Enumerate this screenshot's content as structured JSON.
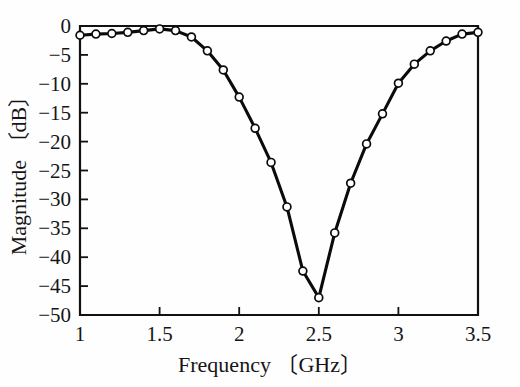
{
  "chart_data": {
    "type": "line",
    "title": "",
    "subtitle": "",
    "xlabel": "Frequency 〔GHz〕",
    "ylabel": "Magnitude 〔dB〕",
    "xlabel_name": "Frequency",
    "xlabel_unit": "〔GHz〕",
    "ylabel_name": "Magnitude",
    "ylabel_unit": "〔dB〕",
    "xlim": [
      1,
      3.5
    ],
    "ylim": [
      -50,
      0
    ],
    "xticks": [
      1,
      1.5,
      2,
      2.5,
      3,
      3.5
    ],
    "xtick_labels": [
      "1",
      "1.5",
      "2",
      "2.5",
      "3",
      "3.5"
    ],
    "yticks": [
      0,
      -5,
      -10,
      -15,
      -20,
      -25,
      -30,
      -35,
      -40,
      -45,
      -50
    ],
    "ytick_labels": [
      "0",
      "−5",
      "−10",
      "−15",
      "−20",
      "−25",
      "−30",
      "−35",
      "−40",
      "−45",
      "−50"
    ],
    "grid": false,
    "legend": false,
    "legend_position": "none",
    "line_color": "#0b0b0b",
    "marker_style": "open-circle",
    "marker_face_color": "#ffffff",
    "marker_edge_color": "#0b0b0b",
    "x": [
      1.0,
      1.1,
      1.2,
      1.3,
      1.4,
      1.5,
      1.6,
      1.7,
      1.8,
      1.9,
      2.0,
      2.1,
      2.2,
      2.3,
      2.4,
      2.5,
      2.6,
      2.7,
      2.8,
      2.9,
      3.0,
      3.1,
      3.2,
      3.3,
      3.4,
      3.5
    ],
    "values": [
      -1.6,
      -1.4,
      -1.3,
      -1.1,
      -0.8,
      -0.5,
      -0.8,
      -1.9,
      -4.3,
      -7.6,
      -12.3,
      -17.7,
      -23.6,
      -31.3,
      -42.4,
      -47.0,
      -35.8,
      -27.2,
      -20.4,
      -15.2,
      -9.9,
      -6.6,
      -4.3,
      -2.6,
      -1.4,
      -1.1
    ],
    "series": [
      {
        "name": "Magnitude",
        "values": [
          -1.6,
          -1.4,
          -1.3,
          -1.1,
          -0.8,
          -0.5,
          -0.8,
          -1.9,
          -4.3,
          -7.6,
          -12.3,
          -17.7,
          -23.6,
          -31.3,
          -42.4,
          -47.0,
          -35.8,
          -27.2,
          -20.4,
          -15.2,
          -9.9,
          -6.6,
          -4.3,
          -2.6,
          -1.4,
          -1.1
        ]
      }
    ],
    "annotations": []
  }
}
